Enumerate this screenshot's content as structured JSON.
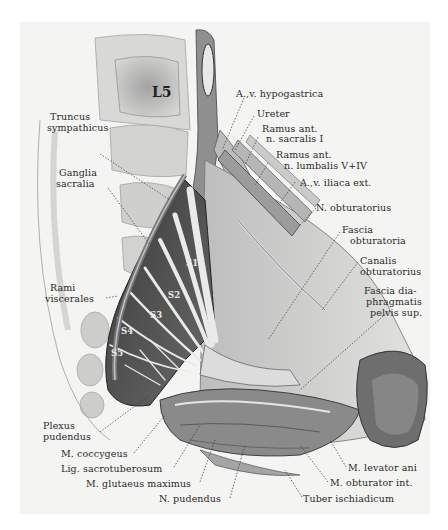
{
  "figure": {
    "type": "anatomical-illustration",
    "vertebra_label": "L5",
    "nerve_roots": [
      "S1",
      "S2",
      "S3",
      "S4",
      "S5"
    ]
  },
  "labels": {
    "av_hypogastrica": "A.,v. hypogastrica",
    "ureter": "Ureter",
    "ramus_sacralis_1": "Ramus ant.",
    "ramus_sacralis_2": "n. sacralis I",
    "ramus_lumbalis_1": "Ramus ant.",
    "ramus_lumbalis_2": "n. lumbalis V+IV",
    "av_iliaca_ext": "A.,v. iliaca ext.",
    "n_obturatorius": "N. obturatorius",
    "fascia_obturatoria_1": "Fascia",
    "fascia_obturatoria_2": "obturatoria",
    "canalis_obturatorius_1": "Canalis",
    "canalis_obturatorius_2": "obturatorius",
    "fascia_diaphragmatis_1": "Fascia dia-",
    "fascia_diaphragmatis_2": "phragmatis",
    "fascia_diaphragmatis_3": "pelvis sup.",
    "truncus_sympathicus_1": "Truncus",
    "truncus_sympathicus_2": "sympathicus",
    "ganglia_sacralia_1": "Ganglia",
    "ganglia_sacralia_2": "sacralia",
    "rami_viscerales_1": "Rami",
    "rami_viscerales_2": "viscerales",
    "plexus_pudendus_1": "Plexus",
    "plexus_pudendus_2": "pudendus",
    "m_coccygeus": "M. coccygeus",
    "lig_sacrotuberosum": "Lig. sacrotuberosum",
    "m_glutaeus_maximus": "M. glutaeus maximus",
    "n_pudendus": "N. pudendus",
    "m_levator_ani": "M. levator ani",
    "m_obturator_int": "M. obturator int.",
    "tuber_ischiadicum": "Tuber ischiadicum"
  },
  "colors": {
    "background": "#ffffff",
    "plate": "#f4f4f2",
    "ink": "#2a2a2a"
  }
}
